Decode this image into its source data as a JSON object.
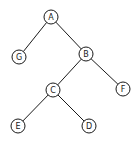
{
  "diagram": {
    "type": "binary-tree",
    "node_radius": 7,
    "nodes": [
      {
        "id": "A",
        "label": "A",
        "x": 51,
        "y": 17
      },
      {
        "id": "G",
        "label": "G",
        "x": 19,
        "y": 57
      },
      {
        "id": "B",
        "label": "B",
        "x": 86,
        "y": 54
      },
      {
        "id": "C",
        "label": "C",
        "x": 53,
        "y": 90
      },
      {
        "id": "F",
        "label": "F",
        "x": 123,
        "y": 89
      },
      {
        "id": "E",
        "label": "E",
        "x": 18,
        "y": 126
      },
      {
        "id": "D",
        "label": "D",
        "x": 89,
        "y": 126
      }
    ],
    "edges": [
      {
        "from": "A",
        "to": "G"
      },
      {
        "from": "A",
        "to": "B"
      },
      {
        "from": "B",
        "to": "C"
      },
      {
        "from": "B",
        "to": "F"
      },
      {
        "from": "C",
        "to": "E"
      },
      {
        "from": "C",
        "to": "D"
      }
    ],
    "colors": {
      "stroke": "#1a1a1a",
      "background": "#ffffff"
    }
  }
}
